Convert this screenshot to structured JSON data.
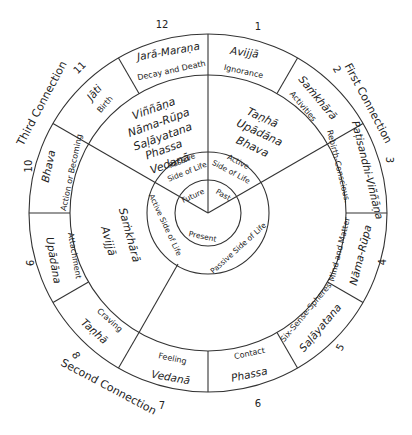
{
  "segments": [
    {
      "number": "1",
      "pali": "Avijjā",
      "english": "Ignorance"
    },
    {
      "number": "2",
      "pali": "Saṁkhārā",
      "english": "Activities"
    },
    {
      "number": "3",
      "pali": "Paṭisandhi-Viññāṇa",
      "english": "Rebirth-Conscious."
    },
    {
      "number": "4",
      "pali": "Nāma-Rūpa",
      "english": "Mind and Matter"
    },
    {
      "number": "5",
      "pali": "Saḷāyatana",
      "english": "Six-Sense-Spheres"
    },
    {
      "number": "6",
      "pali": "Phassa",
      "english": "Contact"
    },
    {
      "number": "7",
      "pali": "Vedanā",
      "english": "Feeling"
    },
    {
      "number": "8",
      "pali": "Taṇhā",
      "english": "Craving"
    },
    {
      "number": "9",
      "pali": "Upādāna",
      "english": "Attachment"
    },
    {
      "number": "10",
      "pali": "Bhava",
      "english": "Action or Becoming"
    },
    {
      "number": "11",
      "pali": "Jāti",
      "english": "Birth"
    },
    {
      "number": "12",
      "pali": "Jarā-Maraṇa",
      "english": "Decay and Death"
    }
  ],
  "connections": {
    "first": "First Connection",
    "second": "Second Connection",
    "third": "Third Connection"
  },
  "middle_ring": {
    "future_list": [
      "Viññāṇa",
      "Nāma-Rūpa",
      "Saḷāyatana",
      "Phassa",
      "Vedanā"
    ],
    "present_list": [
      "Taṇhā",
      "Upādāna",
      "Bhava"
    ],
    "past_list": [
      "Saṁkhārā",
      "Avijjā"
    ]
  },
  "sides": {
    "passive_upper": [
      "Passive",
      "Side of Life"
    ],
    "active_upper": [
      "Active",
      "Side of Life"
    ],
    "active_left": "Active Side of Life",
    "passive_lower": "Passive Side of Life"
  },
  "times": {
    "future": "Future",
    "past": "Past",
    "present": "Present"
  }
}
